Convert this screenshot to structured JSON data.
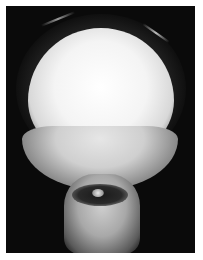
{
  "image": {
    "subject": "radiograph of human skull, frontal view",
    "colors": {
      "background": "#ffffff",
      "film": "#0a0a0a",
      "bone": "#f4f4f4"
    }
  }
}
